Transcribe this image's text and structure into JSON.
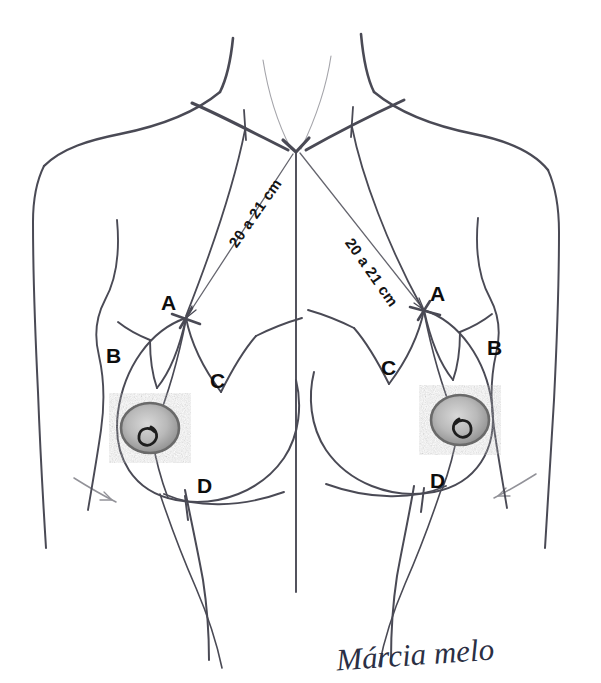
{
  "diagram": {
    "background_color": "#ffffff",
    "ink_color": "#4a4a55",
    "label_color": "#0d0d0d",
    "signature_color": "#2b2f44"
  },
  "measurements": [
    {
      "id": "left-measure",
      "text": "20 a 21 cm",
      "x": 232,
      "y": 238,
      "rotation": -55
    },
    {
      "id": "right-measure",
      "text": "20 a 21 cm",
      "x": 349,
      "y": 232,
      "rotation": 55
    }
  ],
  "points": [
    {
      "id": "left-a",
      "text": "A",
      "x": 161,
      "y": 292
    },
    {
      "id": "left-b",
      "text": "B",
      "x": 106,
      "y": 345
    },
    {
      "id": "left-c",
      "text": "C",
      "x": 210,
      "y": 370
    },
    {
      "id": "left-d",
      "text": "D",
      "x": 197,
      "y": 475
    },
    {
      "id": "right-a",
      "text": "A",
      "x": 430,
      "y": 283
    },
    {
      "id": "right-b",
      "text": "B",
      "x": 487,
      "y": 337
    },
    {
      "id": "right-c",
      "text": "C",
      "x": 381,
      "y": 357
    },
    {
      "id": "right-d",
      "text": "D",
      "x": 430,
      "y": 470
    }
  ],
  "signature": {
    "text": "Márcia melo",
    "x": 336,
    "y": 637
  }
}
